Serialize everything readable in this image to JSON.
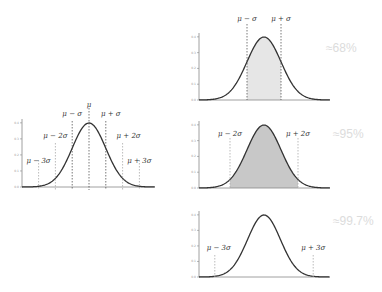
{
  "chart_data": [
    {
      "type": "line",
      "title": "Normal distribution with standard deviation markers",
      "xlabel": "",
      "ylabel": "",
      "x_ticks": [
        "μ−3σ",
        "μ−2σ",
        "μ−σ",
        "μ",
        "μ+σ",
        "μ+2σ",
        "μ+3σ"
      ],
      "y_ticks": [
        "0.0",
        "0.1",
        "0.2",
        "0.3",
        "0.4"
      ],
      "ylim": [
        0,
        0.42
      ],
      "xlim": [
        -4,
        4
      ],
      "grid": false,
      "series": [
        {
          "name": "pdf",
          "function": "standard normal density",
          "peak": 0.399
        }
      ],
      "annotations": [
        "μ − 3σ",
        "μ − 2σ",
        "μ − σ",
        "μ",
        "μ + σ",
        "μ + 2σ",
        "μ + 3σ"
      ]
    },
    {
      "type": "area",
      "title": "",
      "shaded_range": [
        -1,
        1
      ],
      "annotations": [
        "μ − σ",
        "μ + σ"
      ],
      "label": "≈68%",
      "y_ticks": [
        "0.0",
        "0.1",
        "0.2",
        "0.3",
        "0.4"
      ]
    },
    {
      "type": "area",
      "title": "",
      "shaded_range": [
        -2,
        2
      ],
      "annotations": [
        "μ − 2σ",
        "μ + 2σ"
      ],
      "label": "≈95%",
      "y_ticks": [
        "0.0",
        "0.1",
        "0.2",
        "0.3",
        "0.4"
      ]
    },
    {
      "type": "line",
      "title": "",
      "shaded_range": [
        -3,
        3
      ],
      "annotations": [
        "μ − 3σ",
        "μ + 3σ"
      ],
      "label": "≈99.7%",
      "y_ticks": [
        "0.0",
        "0.1",
        "0.2",
        "0.3",
        "0.4"
      ]
    }
  ],
  "labels": {
    "pct68": "≈68%",
    "pct95": "≈95%",
    "pct997": "≈99.7%"
  },
  "colors": {
    "curve": "#333333",
    "shade1": "#e6e6e6",
    "shade2": "#c8c8c8",
    "dash": "#555555",
    "dash_light": "#aaaaaa",
    "pct_text": "#dcdcdc"
  }
}
